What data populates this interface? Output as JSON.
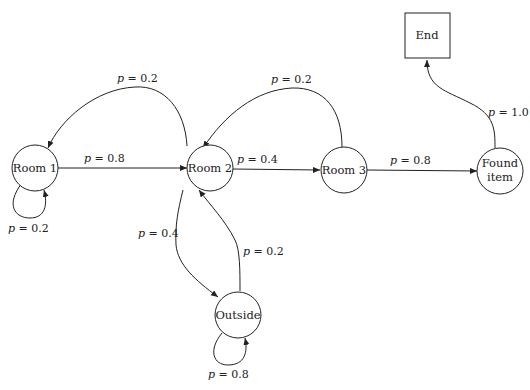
{
  "diagram": {
    "type": "state-transition-graph",
    "nodes": [
      {
        "id": "room1",
        "label": "Room 1",
        "shape": "circle"
      },
      {
        "id": "room2",
        "label": "Room 2",
        "shape": "circle"
      },
      {
        "id": "room3",
        "label": "Room 3",
        "shape": "circle"
      },
      {
        "id": "found",
        "label_line1": "Found",
        "label_line2": "item",
        "shape": "circle"
      },
      {
        "id": "outside",
        "label": "Outside",
        "shape": "circle"
      },
      {
        "id": "end",
        "label": "End",
        "shape": "square"
      }
    ],
    "edges": [
      {
        "from": "room1",
        "to": "room2",
        "var": "p",
        "value": "= 0.8"
      },
      {
        "from": "room1",
        "to": "room1",
        "var": "p",
        "value": "= 0.2"
      },
      {
        "from": "room2",
        "to": "room1",
        "var": "p",
        "value": "= 0.2"
      },
      {
        "from": "room2",
        "to": "room3",
        "var": "p",
        "value": "= 0.4"
      },
      {
        "from": "room2",
        "to": "outside",
        "var": "p",
        "value": "= 0.4"
      },
      {
        "from": "room3",
        "to": "room2",
        "var": "p",
        "value": "= 0.2"
      },
      {
        "from": "room3",
        "to": "found",
        "var": "p",
        "value": "= 0.8"
      },
      {
        "from": "outside",
        "to": "room2",
        "var": "p",
        "value": "= 0.2"
      },
      {
        "from": "outside",
        "to": "outside",
        "var": "p",
        "value": "= 0.8"
      },
      {
        "from": "found",
        "to": "end",
        "var": "p",
        "value": "= 1.0"
      }
    ]
  }
}
